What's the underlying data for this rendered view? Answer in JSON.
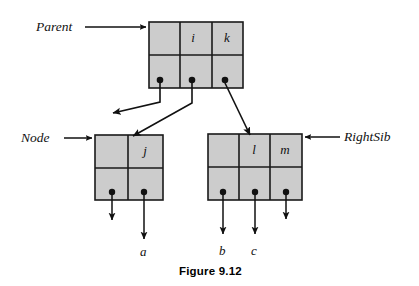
{
  "figure": {
    "caption": "Figure 9.12",
    "background_color": "#ffffff",
    "node_fill_color": "#cccccc",
    "stroke_color": "#1a1a1a"
  },
  "pointer_labels": {
    "parent": "Parent",
    "node": "Node",
    "right_sib": "RightSib"
  },
  "nodes": {
    "parent": {
      "name": "parent-node",
      "keys": [
        "",
        "i",
        "k"
      ],
      "pointer_count": 3,
      "x": 149,
      "y": 22,
      "width": 94,
      "height": 66
    },
    "node": {
      "name": "node-node",
      "keys": [
        "",
        "j"
      ],
      "pointer_count": 2,
      "x": 95,
      "y": 135,
      "width": 68,
      "height": 65
    },
    "right_sib": {
      "name": "right-sib-node",
      "keys": [
        "",
        "l",
        "m"
      ],
      "pointer_count": 3,
      "x": 208,
      "y": 134,
      "width": 94,
      "height": 66
    }
  },
  "leaf_labels": {
    "a": "a",
    "b": "b",
    "c": "c"
  }
}
